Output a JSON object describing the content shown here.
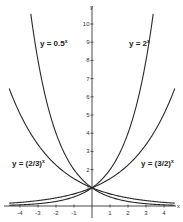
{
  "chart_data": {
    "type": "line",
    "title": "",
    "xlabel": "x",
    "ylabel": "y",
    "xlim": [
      -4.5,
      4.5
    ],
    "ylim": [
      0,
      10.5
    ],
    "grid": false,
    "legend_position": "inline labels",
    "x_ticks": [
      -4,
      -3,
      -2,
      -1,
      1,
      2,
      3,
      4
    ],
    "y_ticks": [
      1,
      2,
      3,
      4,
      5,
      6,
      7,
      8,
      9,
      10
    ],
    "series": [
      {
        "name": "y = 0.5^x",
        "base": 0.5,
        "label": {
          "text": "y = 0.5",
          "sup": "x"
        }
      },
      {
        "name": "y = 2^x",
        "base": 2,
        "label": {
          "text": "y = 2",
          "sup": "x"
        }
      },
      {
        "name": "y = (2/3)^x",
        "base": 0.6667,
        "label": {
          "text": "y = (2/3)",
          "sup": "x"
        }
      },
      {
        "name": "y = (3/2)^x",
        "base": 1.5,
        "label": {
          "text": "y = (3/2)",
          "sup": "x"
        }
      }
    ],
    "annotations": [
      "All curves pass through (0, 1)"
    ]
  },
  "axes": {
    "x_axis_label": "x",
    "y_axis_label": "y",
    "x_tick_labels": [
      "-4",
      "-3",
      "-2",
      "-1",
      "1",
      "2",
      "3",
      "4"
    ],
    "y_tick_labels": [
      "1",
      "2",
      "3",
      "4",
      "5",
      "6",
      "7",
      "8",
      "9",
      "10"
    ]
  },
  "labels": {
    "half": {
      "main": "y = 0.5",
      "sup": "x"
    },
    "two": {
      "main": "y = 2",
      "sup": "x"
    },
    "two_thirds": {
      "main": "y = (2/3)",
      "sup": "x"
    },
    "three_halves": {
      "main": "y = (3/2)",
      "sup": "x"
    }
  },
  "colors": {
    "curve": "#2a2a2a",
    "axis": "#333333",
    "background": "#ffffff"
  }
}
